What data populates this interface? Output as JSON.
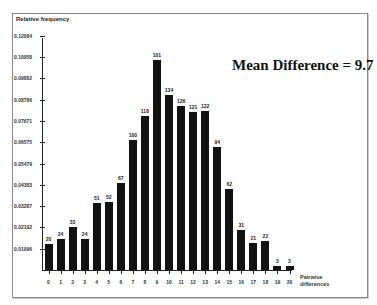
{
  "chart_data": {
    "type": "bar",
    "title": "",
    "ylabel": "Relative frequency",
    "xlabel": "Pairwise differences",
    "annotation": "Mean Difference = 9.7",
    "categories": [
      "0",
      "1",
      "2",
      "3",
      "4",
      "5",
      "6",
      "7",
      "8",
      "9",
      "10",
      "11",
      "12",
      "13",
      "14",
      "15",
      "16",
      "17",
      "18",
      "19",
      "20"
    ],
    "values": [
      20,
      24,
      33,
      24,
      51,
      52,
      67,
      100,
      118,
      161,
      134,
      126,
      121,
      122,
      94,
      62,
      31,
      21,
      22,
      3,
      3
    ],
    "bar_labels": [
      "20",
      "24",
      "33",
      "24",
      "51",
      "52",
      "67",
      "100",
      "118",
      "101",
      "134",
      "126",
      "121",
      "122",
      "94",
      "62",
      "31",
      "21",
      "22",
      "3",
      "3"
    ],
    "yticks": [
      "0.01096",
      "0.02192",
      "0.03287",
      "0.04383",
      "0.05479",
      "0.06575",
      "0.07671",
      "0.08766",
      "0.09862",
      "0.10958",
      "0.12064"
    ],
    "ylim": [
      0,
      0.12064
    ],
    "grid": false,
    "legend": null,
    "bar_color": "#111111"
  }
}
